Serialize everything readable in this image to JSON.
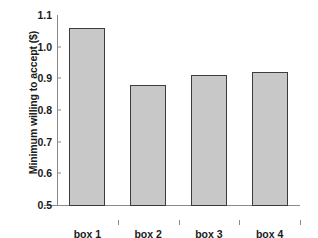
{
  "chart_data": {
    "type": "bar",
    "title": "",
    "xlabel": "",
    "ylabel": "Minimum willing to accept ($)",
    "categories": [
      "box 1",
      "box 2",
      "box 3",
      "box 4"
    ],
    "values": [
      1.06,
      0.88,
      0.91,
      0.92
    ],
    "ylim": [
      0.5,
      1.1
    ],
    "ytick_labels": [
      "1.1",
      "1.0",
      "0.9",
      "0.8",
      "0.7",
      "0.6",
      "0.5"
    ],
    "ytick_values": [
      1.1,
      1.0,
      0.9,
      0.8,
      0.7,
      0.6,
      0.5
    ],
    "grid": false,
    "legend": "none",
    "series": [
      {
        "name": "Minimum willing to accept ($)",
        "values": [
          1.06,
          0.88,
          0.91,
          0.92
        ]
      }
    ],
    "colors": {
      "bar_fill": "#c8c8c8",
      "bar_edge": "#3c3c3c",
      "axis": "#8a8a8a",
      "text": "#1a1a1a",
      "background": "#ffffff"
    }
  }
}
